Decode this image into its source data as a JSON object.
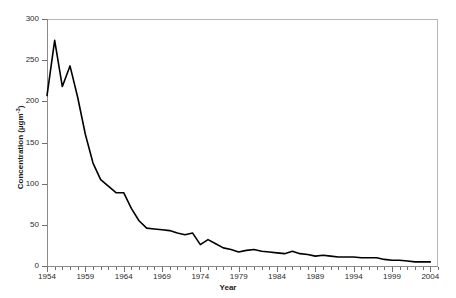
{
  "chart_data": {
    "type": "line",
    "title": "",
    "xlabel": "Year",
    "ylabel": "Concentration (µgm⁻³)",
    "ylabel_text": "Concentration (µgm",
    "ylabel_sup": "-3",
    "ylabel_tail": ")",
    "xlim": [
      1954,
      2005
    ],
    "ylim": [
      0,
      300
    ],
    "grid": false,
    "legend": null,
    "legend_position": "none",
    "line_color": "#000000",
    "line_width": 1.6,
    "x_tick_labels": [
      "1954",
      "1959",
      "1964",
      "1969",
      "1974",
      "1979",
      "1984",
      "1989",
      "1994",
      "1999",
      "2004"
    ],
    "x_tick_values": [
      1954,
      1959,
      1964,
      1969,
      1974,
      1979,
      1984,
      1989,
      1994,
      1999,
      2004
    ],
    "x_minor_tick_interval": 1,
    "y_tick_labels": [
      "0",
      "50",
      "100",
      "150",
      "200",
      "250",
      "300"
    ],
    "y_tick_values": [
      0,
      50,
      100,
      150,
      200,
      250,
      300
    ],
    "x": [
      1954,
      1955,
      1956,
      1957,
      1958,
      1959,
      1960,
      1961,
      1962,
      1963,
      1964,
      1965,
      1966,
      1967,
      1968,
      1969,
      1970,
      1971,
      1972,
      1973,
      1974,
      1975,
      1976,
      1977,
      1978,
      1979,
      1980,
      1981,
      1982,
      1983,
      1984,
      1985,
      1986,
      1987,
      1988,
      1989,
      1990,
      1991,
      1992,
      1993,
      1994,
      1995,
      1996,
      1997,
      1998,
      1999,
      2000,
      2001,
      2002,
      2003,
      2004
    ],
    "values": [
      207,
      274,
      218,
      243,
      205,
      160,
      125,
      105,
      97,
      89,
      89,
      70,
      55,
      46,
      45,
      44,
      43,
      40,
      38,
      40,
      26,
      32,
      27,
      22,
      20,
      17,
      19,
      20,
      18,
      17,
      16,
      15,
      18,
      15,
      14,
      12,
      13,
      12,
      11,
      11,
      11,
      10,
      10,
      10,
      8,
      7,
      7,
      6,
      5,
      5,
      5
    ],
    "series": [
      {
        "name": "Concentration",
        "values": [
          207,
          274,
          218,
          243,
          205,
          160,
          125,
          105,
          97,
          89,
          89,
          70,
          55,
          46,
          45,
          44,
          43,
          40,
          38,
          40,
          26,
          32,
          27,
          22,
          20,
          17,
          19,
          20,
          18,
          17,
          16,
          15,
          18,
          15,
          14,
          12,
          13,
          12,
          11,
          11,
          11,
          10,
          10,
          10,
          8,
          7,
          7,
          6,
          5,
          5,
          5
        ]
      }
    ]
  }
}
